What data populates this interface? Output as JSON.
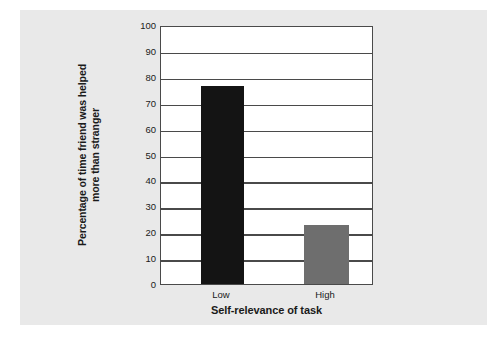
{
  "chart_data": {
    "type": "bar",
    "title": "",
    "categories": [
      "Low",
      "High"
    ],
    "values": [
      76.5,
      22.8
    ],
    "xlabel": "Self-relevance of task",
    "ylabel": "Percentage of time friend was helped more than stranger",
    "ylabel_lines": [
      "Percentage of time friend was helped",
      "more than stranger"
    ],
    "ylim": [
      0,
      100
    ],
    "ytick_labels": [
      "100",
      "90",
      "80",
      "70",
      "60",
      "50",
      "40",
      "30",
      "20",
      "10",
      "0"
    ],
    "ytick_values": [
      100,
      90,
      80,
      70,
      60,
      50,
      40,
      30,
      20,
      10,
      0
    ],
    "grid": true,
    "legend": "none",
    "bar_colors": [
      "#141414",
      "#6e6e6e"
    ],
    "frame_color": "#4a4a4a",
    "plot_background": "#ffffff",
    "figure_background": "#e9e9e9"
  }
}
